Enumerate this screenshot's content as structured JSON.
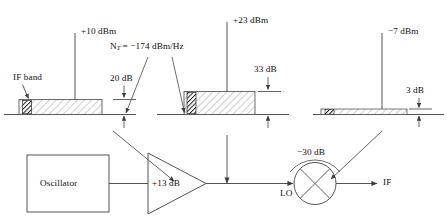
{
  "diagram": {
    "stages": [
      {
        "name": "oscillator-output-spectrum",
        "signal_level": "+10 dBm",
        "noise_floor_label": "20 dB",
        "band_label": "IF band"
      },
      {
        "name": "amplifier-output-spectrum",
        "signal_level": "+23 dBm",
        "noise_floor_label": "33 dB",
        "noise_source_label": "N_T = −174 dBm/Hz"
      },
      {
        "name": "mixer-output-spectrum",
        "signal_level": "−7 dBm",
        "noise_floor_label": "3 dB"
      }
    ],
    "blocks": [
      {
        "name": "oscillator",
        "label": "Oscillator"
      },
      {
        "name": "amplifier",
        "label": "+13 dB"
      },
      {
        "name": "mixer",
        "label": "−30 dB"
      }
    ],
    "ports": [
      {
        "name": "lo-port",
        "label": "LO"
      },
      {
        "name": "if-port",
        "label": "IF"
      }
    ],
    "labels": {
      "plus_10_dbm": "+10 dBm",
      "plus_23_dbm": "+23 dBm",
      "minus_7_dbm": "−7 dBm",
      "if_band": "IF band",
      "twenty_db": "20 dB",
      "thirty_three_db": "33 dB",
      "three_db": "3 dB",
      "noise_temp_prefix": "N",
      "noise_temp_sub": "T",
      "noise_temp_value": "= −174 dBm/Hz",
      "oscillator": "Oscillator",
      "amp_gain": "+13 dB",
      "mixer_loss": "−30 dB",
      "lo": "LO",
      "if": "IF"
    },
    "colors": {
      "line": "#4a4a4a",
      "text": "#111111",
      "hatch": "#8a8a8a",
      "fill": "#ffffff",
      "band_dark": "#1c1c1c"
    }
  }
}
